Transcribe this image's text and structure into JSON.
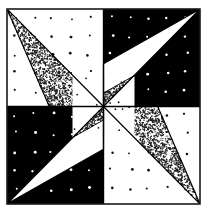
{
  "figure": {
    "caption": "",
    "canvas": {
      "width": 210,
      "height": 219
    },
    "frame": {
      "x": 7,
      "y": 9,
      "width": 193,
      "height": 195,
      "stroke": "#1a1a1a",
      "stroke_width": 1.6
    },
    "center": {
      "x": 103.5,
      "y": 106.5
    },
    "colors": {
      "background": "#ffffff",
      "ink": "#000000",
      "paper": "#ffffff",
      "frame_stroke": "#1a1a1a",
      "stipple_dark": "#1c1c1c",
      "dot_light_on_dark": "#ffffff",
      "dot_dark_on_light": "#111111"
    },
    "quadrants": [
      {
        "name": "top-left",
        "fill": "paper",
        "dot_color": "#111111",
        "dot_label": "sparse-dark-dots"
      },
      {
        "name": "top-right",
        "fill": "ink",
        "dot_color": "#ffffff",
        "dot_label": "sparse-white-dots"
      },
      {
        "name": "bottom-left",
        "fill": "ink",
        "dot_color": "#ffffff",
        "dot_label": "sparse-white-dots"
      },
      {
        "name": "bottom-right",
        "fill": "paper",
        "dot_color": "#111111",
        "dot_label": "sparse-dark-dots"
      }
    ],
    "triangles": [
      {
        "name": "top-left-stippled-triangle",
        "style": "stippled",
        "from_corner": "top-left"
      },
      {
        "name": "top-right-white-triangle",
        "style": "white",
        "from_corner": "top-right"
      },
      {
        "name": "bottom-left-white-triangle",
        "style": "white",
        "from_corner": "bottom-left"
      },
      {
        "name": "bottom-right-stippled-triangle",
        "style": "stippled",
        "from_corner": "bottom-right"
      }
    ],
    "center_motif": {
      "name": "self-similar-center-pinwheel",
      "size": 62,
      "description": "smaller copy of the four-quadrant pinwheel at the centre"
    },
    "dot_grid": {
      "spacing": 18.5,
      "radius": 1.15,
      "jitter": 4.2
    },
    "stipple": {
      "density": 0.46,
      "dot_radius": 0.62
    }
  }
}
